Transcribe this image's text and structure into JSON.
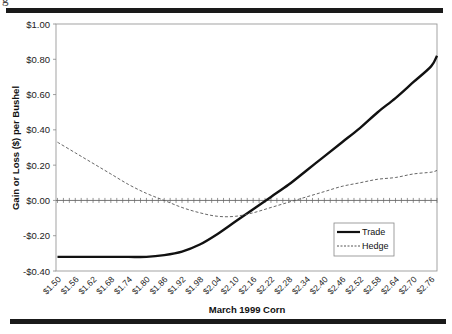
{
  "header": {
    "cut_text": "g"
  },
  "chart_data": {
    "type": "line",
    "title": "",
    "xlabel": "March 1999 Corn",
    "ylabel": "Gain or Loss ($) per Bushel",
    "ylim": [
      -0.4,
      1.0
    ],
    "y_ticks": [
      "$1.00",
      "$0.80",
      "$0.60",
      "$0.40",
      "$0.20",
      "$0.00",
      "-$0.20",
      "-$0.40"
    ],
    "y_tick_values": [
      1.0,
      0.8,
      0.6,
      0.4,
      0.2,
      0.0,
      -0.2,
      -0.4
    ],
    "x_tick_labels": [
      "$1.50",
      "$1.56",
      "$1.62",
      "$1.68",
      "$1.74",
      "$1.80",
      "$1.86",
      "$1.92",
      "$1.98",
      "$2.04",
      "$2.10",
      "$2.16",
      "$2.22",
      "$2.28",
      "$2.34",
      "$2.40",
      "$2.46",
      "$2.52",
      "$2.58",
      "$2.64",
      "$2.70",
      "$2.76"
    ],
    "x": [
      1.5,
      1.56,
      1.62,
      1.68,
      1.74,
      1.8,
      1.86,
      1.92,
      1.98,
      2.04,
      2.1,
      2.16,
      2.22,
      2.28,
      2.34,
      2.4,
      2.46,
      2.52,
      2.58,
      2.64,
      2.7,
      2.76,
      2.78
    ],
    "series": [
      {
        "name": "Trade",
        "style": "solid-thick",
        "color": "#111111",
        "values": [
          -0.32,
          -0.32,
          -0.32,
          -0.32,
          -0.32,
          -0.32,
          -0.31,
          -0.29,
          -0.25,
          -0.19,
          -0.12,
          -0.05,
          0.02,
          0.09,
          0.17,
          0.25,
          0.33,
          0.41,
          0.5,
          0.58,
          0.67,
          0.76,
          0.82
        ]
      },
      {
        "name": "Hedge",
        "style": "dashed",
        "color": "#555555",
        "values": [
          0.33,
          0.27,
          0.21,
          0.15,
          0.09,
          0.04,
          0.0,
          -0.04,
          -0.07,
          -0.09,
          -0.09,
          -0.07,
          -0.04,
          -0.01,
          0.02,
          0.05,
          0.08,
          0.1,
          0.12,
          0.13,
          0.15,
          0.16,
          0.17
        ]
      }
    ],
    "legend": {
      "position": "lower-right inside",
      "entries": [
        "Trade",
        "Hedge"
      ]
    },
    "grid": false,
    "zero_line_with_ticks": true
  }
}
